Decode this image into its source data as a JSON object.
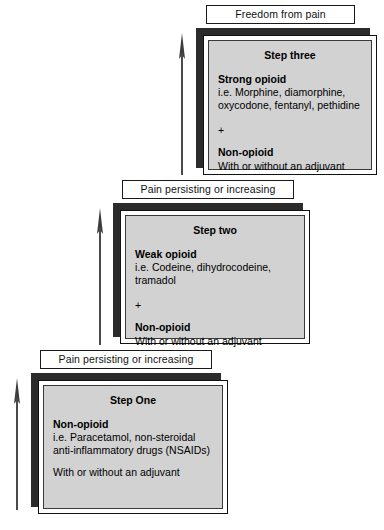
{
  "diagram": {
    "colors": {
      "card_fill": "#d2d2d2",
      "card_shadow": "#2b2b2b",
      "card_border": "#111111",
      "caption_fill": "#ffffff",
      "text": "#000000",
      "arrow": "#4a4a4a"
    }
  },
  "captions": [
    {
      "id": "caption-step-three",
      "label": "Freedom from pain"
    },
    {
      "id": "caption-step-two",
      "label": "Pain persisting or increasing"
    },
    {
      "id": "caption-step-one",
      "label": "Pain persisting or increasing"
    }
  ],
  "arrows": [
    {
      "id": "arrow-step-three",
      "direction": "up"
    },
    {
      "id": "arrow-step-two",
      "direction": "up"
    },
    {
      "id": "arrow-step-one",
      "direction": "up"
    }
  ],
  "steps": [
    {
      "id": "step-three",
      "title": "Step three",
      "primary_drug": "Strong opioid",
      "primary_desc": "i.e. Morphine, diamorphine,\noxycodone, fentanyl, pethidine",
      "connector": "+",
      "secondary_drug": "Non-opioid",
      "secondary_desc": "With or without an adjuvant"
    },
    {
      "id": "step-two",
      "title": "Step two",
      "primary_drug": "Weak opioid",
      "primary_desc": "i.e. Codeine, dihydrocodeine,\ntramadol",
      "connector": "+",
      "secondary_drug": "Non-opioid",
      "secondary_desc": "With or without an adjuvant"
    },
    {
      "id": "step-one",
      "title": "Step One",
      "primary_drug": "Non-opioid",
      "primary_desc": "i.e. Paracetamol, non-steroidal\nanti-inflammatory drugs (NSAIDs)",
      "connector": "",
      "secondary_drug": "",
      "secondary_desc": "With or without an adjuvant"
    }
  ]
}
